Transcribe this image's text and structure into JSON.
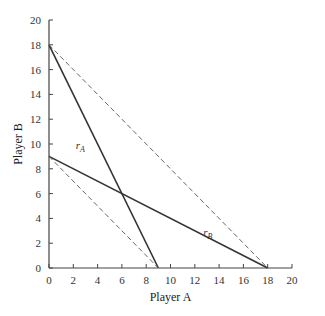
{
  "chart_data": {
    "type": "line",
    "title": "",
    "xlabel": "Player A",
    "ylabel": "Player B",
    "xlim": [
      0,
      20
    ],
    "ylim": [
      0,
      20
    ],
    "xticks": [
      0,
      2,
      4,
      6,
      8,
      10,
      12,
      14,
      16,
      18,
      20
    ],
    "yticks": [
      0,
      2,
      4,
      6,
      8,
      10,
      12,
      14,
      16,
      18,
      20
    ],
    "grid": false,
    "legend": null,
    "series": [
      {
        "name": "r_A",
        "label": "r",
        "subscript": "A",
        "style": "solid",
        "points": [
          [
            0,
            18
          ],
          [
            9,
            0
          ]
        ]
      },
      {
        "name": "r_B",
        "label": "r",
        "subscript": "B",
        "style": "solid",
        "points": [
          [
            0,
            9
          ],
          [
            18,
            0
          ]
        ]
      },
      {
        "name": "outer-dashed",
        "style": "dashed",
        "points": [
          [
            0,
            18
          ],
          [
            18,
            0
          ]
        ]
      },
      {
        "name": "inner-dashed",
        "style": "dashed",
        "points": [
          [
            0,
            9
          ],
          [
            9,
            0
          ]
        ]
      }
    ],
    "annotations": [
      {
        "text": "r_A",
        "x": 2.2,
        "y": 9.6
      },
      {
        "text": "r_B",
        "x": 12.7,
        "y": 2.6
      }
    ],
    "intersection": [
      6,
      6
    ]
  }
}
